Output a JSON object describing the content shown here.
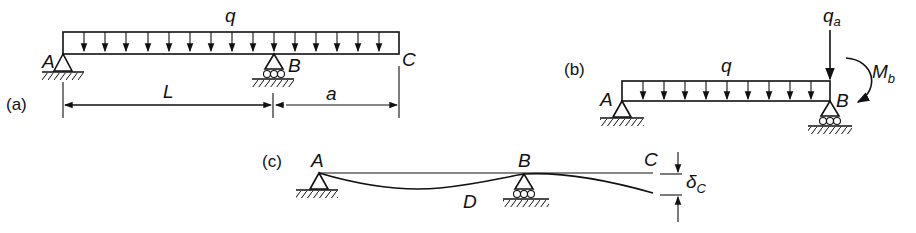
{
  "figure": {
    "panels": [
      {
        "id": "a",
        "caption": "(a)",
        "load_label": "q",
        "points": {
          "A": "A",
          "B": "B",
          "C": "C"
        },
        "dimensions": {
          "span": "L",
          "overhang": "a"
        }
      },
      {
        "id": "b",
        "caption": "(b)",
        "load_label": "q",
        "point_load": {
          "label": "q",
          "sub": "a"
        },
        "moment": {
          "label": "M",
          "sub": "b"
        },
        "points": {
          "A": "A",
          "B": "B"
        }
      },
      {
        "id": "c",
        "caption": "(c)",
        "points": {
          "A": "A",
          "B": "B",
          "C": "C",
          "D": "D"
        },
        "deflection": {
          "label": "δ",
          "sub": "C"
        }
      }
    ]
  }
}
